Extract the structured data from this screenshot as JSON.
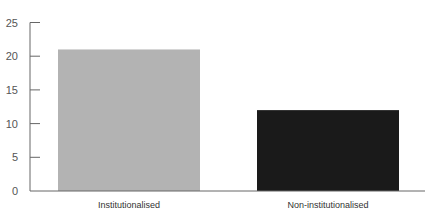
{
  "chart_data": {
    "type": "bar",
    "title": "",
    "xlabel": "",
    "ylabel": "",
    "categories": [
      "Institutionalised",
      "Non-institutionalised"
    ],
    "values": [
      21,
      12
    ],
    "ylim": [
      0,
      25
    ],
    "yticks": [
      0,
      5,
      10,
      15,
      20,
      25
    ],
    "grid": false,
    "legend": null,
    "colors": [
      "#b3b3b3",
      "#1a1a1a"
    ]
  }
}
